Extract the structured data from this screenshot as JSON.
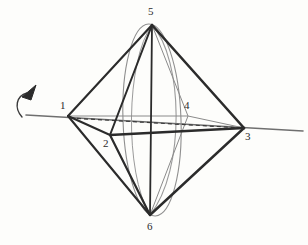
{
  "figure": {
    "background_color": "#fdfdfb",
    "ink_color": "#2b2b2b",
    "thin_color": "#8a8a8a",
    "axis_color": "#6f6f6f"
  },
  "chart_data": {
    "type": "diagram",
    "shape": "octahedron",
    "vertex_labels": [
      "1",
      "2",
      "3",
      "4",
      "5",
      "6"
    ],
    "vertices": [
      {
        "label": "1",
        "x": 68,
        "y": 116,
        "label_x": 60,
        "label_y": 100,
        "position": "left"
      },
      {
        "label": "2",
        "x": 110,
        "y": 135,
        "label_x": 103,
        "label_y": 138,
        "position": "front-lower"
      },
      {
        "label": "3",
        "x": 244,
        "y": 128,
        "label_x": 245,
        "label_y": 131,
        "position": "right"
      },
      {
        "label": "4",
        "x": 188,
        "y": 116,
        "label_x": 184,
        "label_y": 100,
        "position": "back-upper"
      },
      {
        "label": "5",
        "x": 152,
        "y": 25,
        "label_x": 148,
        "label_y": 6,
        "position": "top"
      },
      {
        "label": "6",
        "x": 150,
        "y": 215,
        "label_x": 147,
        "label_y": 221,
        "position": "bottom"
      }
    ],
    "solid_edges": [
      [
        "1",
        "5"
      ],
      [
        "5",
        "3"
      ],
      [
        "1",
        "2"
      ],
      [
        "2",
        "3"
      ],
      [
        "2",
        "5"
      ],
      [
        "1",
        "6"
      ],
      [
        "2",
        "6"
      ],
      [
        "3",
        "6"
      ],
      [
        "5",
        "6"
      ]
    ],
    "thin_edges": [
      [
        "1",
        "4"
      ],
      [
        "4",
        "3"
      ],
      [
        "5",
        "4"
      ],
      [
        "4",
        "6"
      ]
    ],
    "dashed_edges": [
      [
        "1",
        "3"
      ]
    ],
    "rotation_axis": {
      "through_vertices": [
        "1",
        "3"
      ],
      "x_start": 26,
      "y_start": 115,
      "x_end": 303,
      "y_end": 131
    },
    "rotation_arrow": {
      "type": "curved-arrow",
      "direction": "counter-clockwise-about-axis",
      "tip_x": 30,
      "tip_y": 88
    },
    "great_circle": {
      "description": "circle in plane 5-2-6-4 seen edge-on as an ellipse",
      "center_x": 152,
      "center_y": 120,
      "radius_x": 29,
      "radius_y": 96
    },
    "xlabel": "",
    "ylabel": "",
    "legend": []
  }
}
